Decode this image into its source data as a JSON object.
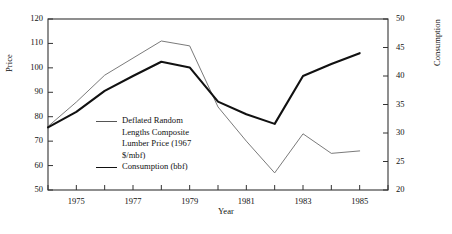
{
  "chart_data": {
    "type": "line",
    "title": "",
    "xlabel": "Year",
    "ylabel": "Price",
    "y2label": "Consumption",
    "grid": false,
    "legend_position": "inside-left",
    "xlim": [
      1974,
      1986
    ],
    "ylim": [
      50,
      120
    ],
    "y2lim": [
      20,
      50
    ],
    "x_tick_step": 1,
    "x_tick_labels": [
      "1975",
      "1977",
      "1979",
      "1981",
      "1983",
      "1985"
    ],
    "x_tick_label_values": [
      1975,
      1977,
      1979,
      1981,
      1983,
      1985
    ],
    "y_tick_labels": [
      "50",
      "60",
      "70",
      "80",
      "90",
      "100",
      "110",
      "120"
    ],
    "y_tick_values": [
      50,
      60,
      70,
      80,
      90,
      100,
      110,
      120
    ],
    "y2_tick_labels": [
      "20",
      "25",
      "30",
      "35",
      "40",
      "45",
      "50"
    ],
    "y2_tick_values": [
      20,
      25,
      30,
      35,
      40,
      45,
      50
    ],
    "x": [
      1974,
      1975,
      1976,
      1977,
      1978,
      1979,
      1980,
      1981,
      1982,
      1983,
      1984,
      1985
    ],
    "series": [
      {
        "name": "Deflated Random Lengths Composite Lumber Price (1967 $/mbf)",
        "axis": "left",
        "style": "thin",
        "values": [
          76,
          86,
          97,
          104,
          111,
          109,
          84,
          70,
          57,
          73,
          65,
          66
        ]
      },
      {
        "name": "Consumption (bbf)",
        "axis": "right",
        "style": "thick",
        "values": [
          31.0,
          33.7,
          37.4,
          40.0,
          42.5,
          41.5,
          35.5,
          33.3,
          31.6,
          40.0,
          42.1,
          44.0
        ]
      }
    ]
  },
  "legend": {
    "entries": [
      {
        "lines": [
          "Deflated Random",
          "Lengths Composite",
          "Lumber Price (1967",
          "$/mbf)"
        ],
        "style": "thin"
      },
      {
        "lines": [
          "Consumption (bbf)"
        ],
        "style": "thick"
      }
    ]
  },
  "colors": {
    "frame": "#333333",
    "series_thin": "#6b6b6b",
    "series_thick": "#111111",
    "text": "#111111",
    "background": "#ffffff"
  }
}
